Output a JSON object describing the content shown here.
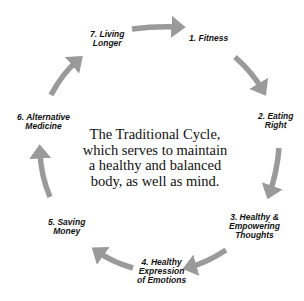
{
  "diagram": {
    "type": "cycle",
    "arrow_color": "#9a9a9a",
    "center_text": {
      "lines": [
        "The Traditional Cycle,",
        "which serves to maintain",
        "a healthy and balanced",
        "body, as well as mind."
      ]
    },
    "steps": [
      {
        "number": 1,
        "lines": [
          "1. Fitness"
        ]
      },
      {
        "number": 2,
        "lines": [
          "2. Eating",
          "Right"
        ]
      },
      {
        "number": 3,
        "lines": [
          "3. Healthy &",
          "Empowering",
          "Thoughts"
        ]
      },
      {
        "number": 4,
        "lines": [
          "4. Healthy",
          "Expression",
          "of Emotions"
        ]
      },
      {
        "number": 5,
        "lines": [
          "5. Saving",
          "Money"
        ]
      },
      {
        "number": 6,
        "lines": [
          "6. Alternative",
          "Medicine"
        ]
      },
      {
        "number": 7,
        "lines": [
          "7. Living",
          "Longer"
        ]
      }
    ],
    "arrows": [
      {
        "from": 7,
        "to": 1
      },
      {
        "from": 1,
        "to": 2
      },
      {
        "from": 2,
        "to": 3
      },
      {
        "from": 3,
        "to": 4
      },
      {
        "from": 4,
        "to": 5
      },
      {
        "from": 5,
        "to": 6
      },
      {
        "from": 6,
        "to": 7
      }
    ]
  }
}
